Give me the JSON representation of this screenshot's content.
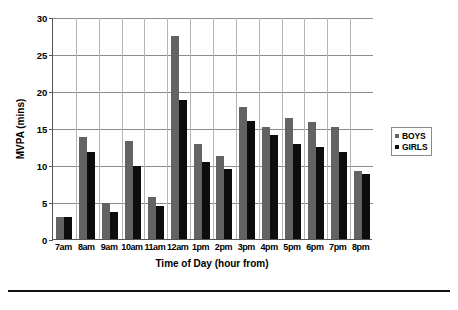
{
  "chart_data": {
    "type": "bar",
    "title": "",
    "xlabel": "Time of Day (hour from)",
    "ylabel": "MVPA (mins)",
    "ylim": [
      0,
      30
    ],
    "yticks": [
      0,
      5,
      10,
      15,
      20,
      25,
      30
    ],
    "grid": true,
    "legend_position": "right",
    "categories": [
      "7am",
      "8am",
      "9am",
      "10am",
      "11am",
      "12am",
      "1pm",
      "2pm",
      "3pm",
      "4pm",
      "5pm",
      "6pm",
      "7pm",
      "8pm"
    ],
    "series": [
      {
        "name": "BOYS",
        "color": "#636363",
        "values": [
          3.0,
          13.8,
          4.9,
          13.3,
          5.7,
          27.5,
          12.9,
          11.2,
          17.9,
          15.1,
          16.4,
          15.8,
          15.2,
          9.2
        ]
      },
      {
        "name": "GIRLS",
        "color": "#0d0d0d",
        "values": [
          3.0,
          11.8,
          3.6,
          9.8,
          4.5,
          18.8,
          10.4,
          9.5,
          15.9,
          14.1,
          12.9,
          12.4,
          11.8,
          8.8
        ]
      }
    ]
  },
  "legend": {
    "items": [
      {
        "label": "BOYS",
        "swatch": "boys-swatch"
      },
      {
        "label": "GIRLS",
        "swatch": "girls-swatch"
      }
    ]
  },
  "axes": {
    "y_tick_labels": [
      "30",
      "25",
      "20",
      "15",
      "10",
      "5",
      "0"
    ],
    "y_axis_title": "MVPA (mins)",
    "x_axis_title": "Time of Day (hour from)",
    "x_tick_labels": [
      "7am",
      "8am",
      "9am",
      "10am",
      "11am",
      "12am",
      "1pm",
      "2pm",
      "3pm",
      "4pm",
      "5pm",
      "6pm",
      "7pm",
      "8pm"
    ]
  }
}
